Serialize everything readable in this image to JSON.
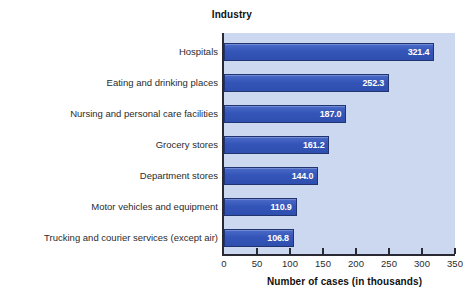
{
  "chart_data": {
    "type": "bar",
    "orientation": "horizontal",
    "title": "Industry",
    "xlabel": "Number of cases (in thousands)",
    "ylabel": "Industry",
    "categories": [
      "Hospitals",
      "Eating and drinking places",
      "Nursing and personal care facilities",
      "Grocery stores",
      "Department stores",
      "Motor vehicles and equipment",
      "Trucking and courier services (except air)"
    ],
    "values": [
      321.4,
      252.3,
      187.0,
      161.2,
      144.0,
      110.9,
      106.8
    ],
    "value_labels": [
      "321.4",
      "252.3",
      "187.0",
      "161.2",
      "144.0",
      "110.9",
      "106.8"
    ],
    "xlim": [
      0,
      350
    ],
    "xticks": [
      0,
      50,
      100,
      150,
      200,
      250,
      300,
      350
    ],
    "xtick_labels": [
      "0",
      "50",
      "100",
      "150",
      "200",
      "250",
      "300",
      "350"
    ],
    "grid": false,
    "legend": null,
    "colors": {
      "bar_fill": "#3455b8",
      "bar_edge": "#22346f",
      "plot_background": "#ccd8ef",
      "figure_background": "#ffffff",
      "axis_line": "#2a2a35",
      "value_label_text": "#ffffff",
      "text": "#2b2b2b"
    }
  }
}
